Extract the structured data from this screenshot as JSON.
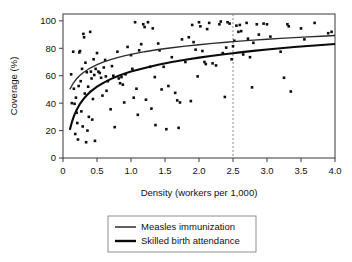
{
  "chart_data": {
    "type": "scatter",
    "title": "",
    "xlabel": "Density (workers per 1,000)",
    "ylabel": "Coverage (%)",
    "xlim": [
      0,
      4.0
    ],
    "ylim": [
      0,
      105
    ],
    "grid": false,
    "xticks": [
      0,
      0.5,
      1.0,
      1.5,
      2.0,
      2.5,
      3.0,
      3.5,
      4.0
    ],
    "xtick_labels": [
      "0",
      "0.5",
      "1.0",
      "1.5",
      "2.0",
      "2.5",
      "3.0",
      "3.5",
      "4.0"
    ],
    "yticks": [
      0,
      20,
      40,
      60,
      80,
      100
    ],
    "ytick_labels": [
      "0",
      "20",
      "40",
      "60",
      "80",
      "100"
    ],
    "legend_position": "below-plot",
    "annotations": [
      {
        "name": "threshold-line",
        "type": "vertical-dashed-line",
        "x": 2.5,
        "label": ""
      }
    ],
    "series": [
      {
        "name": "Measles immunization",
        "type": "curve",
        "style": "thin-line",
        "color": "#2b2b2b",
        "points": [
          [
            0.1,
            50.0
          ],
          [
            0.15,
            54.5
          ],
          [
            0.2,
            57.8
          ],
          [
            0.25,
            60.3
          ],
          [
            0.3,
            62.4
          ],
          [
            0.4,
            65.6
          ],
          [
            0.5,
            68.1
          ],
          [
            0.6,
            70.1
          ],
          [
            0.7,
            71.8
          ],
          [
            0.8,
            73.2
          ],
          [
            0.9,
            74.5
          ],
          [
            1.0,
            75.6
          ],
          [
            1.2,
            77.5
          ],
          [
            1.4,
            79.1
          ],
          [
            1.6,
            80.4
          ],
          [
            1.8,
            81.6
          ],
          [
            2.0,
            82.6
          ],
          [
            2.2,
            83.6
          ],
          [
            2.4,
            84.4
          ],
          [
            2.5,
            84.8
          ],
          [
            2.6,
            85.2
          ],
          [
            2.8,
            85.9
          ],
          [
            3.0,
            86.6
          ],
          [
            3.2,
            87.2
          ],
          [
            3.4,
            87.8
          ],
          [
            3.6,
            88.3
          ],
          [
            3.8,
            88.8
          ],
          [
            4.0,
            89.3
          ]
        ]
      },
      {
        "name": "Skilled birth attendance",
        "type": "curve",
        "style": "thick-line",
        "color": "#0a0a0a",
        "points": [
          [
            0.1,
            20.5
          ],
          [
            0.13,
            26.0
          ],
          [
            0.16,
            30.5
          ],
          [
            0.2,
            35.0
          ],
          [
            0.25,
            39.5
          ],
          [
            0.3,
            43.0
          ],
          [
            0.35,
            45.8
          ],
          [
            0.4,
            48.2
          ],
          [
            0.5,
            52.0
          ],
          [
            0.6,
            55.0
          ],
          [
            0.7,
            57.5
          ],
          [
            0.8,
            59.6
          ],
          [
            0.9,
            61.4
          ],
          [
            1.0,
            63.0
          ],
          [
            1.2,
            65.7
          ],
          [
            1.4,
            68.0
          ],
          [
            1.6,
            70.0
          ],
          [
            1.8,
            71.7
          ],
          [
            2.0,
            73.2
          ],
          [
            2.2,
            74.6
          ],
          [
            2.4,
            75.8
          ],
          [
            2.5,
            76.4
          ],
          [
            2.6,
            77.0
          ],
          [
            2.8,
            78.1
          ],
          [
            3.0,
            79.1
          ],
          [
            3.2,
            80.0
          ],
          [
            3.4,
            80.9
          ],
          [
            3.6,
            81.7
          ],
          [
            3.8,
            82.4
          ],
          [
            4.0,
            83.1
          ]
        ]
      },
      {
        "name": "Measles immunization data points",
        "type": "scatter",
        "marker": "square",
        "color": "#0d0d0d",
        "points": [
          [
            0.12,
            61.0
          ],
          [
            0.13,
            40.0
          ],
          [
            0.15,
            77.5
          ],
          [
            0.16,
            50.5
          ],
          [
            0.18,
            17.5
          ],
          [
            0.19,
            44.0
          ],
          [
            0.2,
            33.0
          ],
          [
            0.21,
            25.5
          ],
          [
            0.22,
            13.5
          ],
          [
            0.24,
            77.0
          ],
          [
            0.25,
            78.0
          ],
          [
            0.26,
            56.0
          ],
          [
            0.27,
            34.0
          ],
          [
            0.28,
            65.0
          ],
          [
            0.29,
            23.0
          ],
          [
            0.3,
            90.5
          ],
          [
            0.31,
            88.0
          ],
          [
            0.32,
            47.0
          ],
          [
            0.33,
            69.5
          ],
          [
            0.34,
            11.5
          ],
          [
            0.35,
            62.5
          ],
          [
            0.36,
            20.0
          ],
          [
            0.37,
            52.0
          ],
          [
            0.38,
            30.0
          ],
          [
            0.4,
            92.0
          ],
          [
            0.41,
            63.0
          ],
          [
            0.42,
            58.0
          ],
          [
            0.44,
            43.0
          ],
          [
            0.45,
            72.0
          ],
          [
            0.46,
            60.5
          ],
          [
            0.47,
            12.5
          ],
          [
            0.48,
            65.0
          ],
          [
            0.5,
            76.5
          ],
          [
            0.52,
            63.0
          ],
          [
            0.54,
            62.0
          ],
          [
            0.56,
            58.5
          ],
          [
            0.58,
            45.5
          ],
          [
            0.6,
            66.0
          ],
          [
            0.62,
            71.5
          ],
          [
            0.64,
            49.0
          ],
          [
            0.66,
            56.0
          ],
          [
            0.7,
            35.5
          ],
          [
            0.72,
            67.0
          ],
          [
            0.74,
            60.0
          ],
          [
            0.76,
            22.5
          ],
          [
            0.8,
            77.5
          ],
          [
            0.82,
            58.0
          ],
          [
            0.84,
            54.5
          ],
          [
            0.86,
            59.0
          ],
          [
            0.88,
            53.5
          ],
          [
            0.9,
            40.5
          ],
          [
            0.95,
            81.0
          ],
          [
            1.0,
            75.0
          ],
          [
            1.02,
            65.0
          ],
          [
            1.04,
            44.0
          ],
          [
            1.06,
            99.0
          ],
          [
            1.08,
            50.5
          ],
          [
            1.1,
            31.5
          ],
          [
            1.12,
            78.5
          ],
          [
            1.15,
            83.0
          ],
          [
            1.18,
            97.5
          ],
          [
            1.2,
            95.5
          ],
          [
            1.22,
            42.5
          ],
          [
            1.25,
            99.0
          ],
          [
            1.28,
            66.5
          ],
          [
            1.3,
            36.0
          ],
          [
            1.32,
            94.5
          ],
          [
            1.35,
            59.0
          ],
          [
            1.36,
            24.0
          ],
          [
            1.4,
            83.5
          ],
          [
            1.45,
            50.0
          ],
          [
            1.48,
            66.5
          ],
          [
            1.52,
            21.0
          ],
          [
            1.55,
            52.5
          ],
          [
            1.6,
            73.5
          ],
          [
            1.65,
            47.5
          ],
          [
            1.68,
            42.0
          ],
          [
            1.7,
            22.0
          ],
          [
            1.72,
            40.5
          ],
          [
            1.75,
            86.5
          ],
          [
            1.8,
            70.0
          ],
          [
            1.85,
            88.0
          ],
          [
            1.88,
            41.5
          ],
          [
            1.9,
            97.0
          ],
          [
            1.92,
            84.5
          ],
          [
            1.95,
            79.0
          ],
          [
            1.98,
            59.5
          ],
          [
            2.0,
            99.0
          ],
          [
            2.02,
            96.0
          ],
          [
            2.05,
            78.0
          ],
          [
            2.08,
            70.0
          ],
          [
            2.1,
            68.5
          ],
          [
            2.15,
            98.5
          ],
          [
            2.2,
            69.0
          ],
          [
            2.25,
            67.5
          ],
          [
            2.3,
            97.5
          ],
          [
            2.32,
            99.5
          ],
          [
            2.35,
            76.5
          ],
          [
            2.38,
            44.5
          ],
          [
            2.4,
            80.5
          ],
          [
            2.42,
            99.0
          ],
          [
            2.45,
            98.0
          ],
          [
            2.48,
            72.0
          ],
          [
            2.5,
            81.5
          ],
          [
            2.52,
            85.5
          ],
          [
            2.55,
            96.5
          ],
          [
            2.58,
            92.0
          ],
          [
            2.6,
            97.0
          ],
          [
            2.65,
            75.5
          ],
          [
            2.7,
            98.5
          ],
          [
            2.72,
            87.0
          ],
          [
            2.75,
            73.5
          ],
          [
            2.78,
            51.5
          ],
          [
            2.8,
            84.0
          ],
          [
            2.85,
            97.5
          ],
          [
            2.88,
            90.0
          ],
          [
            2.95,
            98.0
          ],
          [
            3.0,
            97.5
          ],
          [
            3.05,
            88.5
          ],
          [
            3.2,
            77.5
          ],
          [
            3.25,
            58.5
          ],
          [
            3.3,
            97.5
          ],
          [
            3.32,
            96.0
          ],
          [
            3.35,
            48.5
          ],
          [
            3.5,
            94.5
          ],
          [
            3.55,
            86.5
          ],
          [
            3.7,
            98.5
          ],
          [
            3.9,
            91.0
          ],
          [
            3.95,
            92.0
          ],
          [
            0.17,
            39.5
          ],
          [
            0.23,
            52.5
          ],
          [
            0.43,
            28.0
          ],
          [
            0.63,
            59.5
          ],
          [
            0.92,
            61.0
          ],
          [
            1.42,
            78.5
          ],
          [
            2.12,
            94.0
          ],
          [
            2.62,
            92.5
          ]
        ]
      }
    ]
  },
  "axes": {
    "x_title": "Density (workers per 1,000)",
    "y_title": "Coverage (%)",
    "x_labels": [
      "0",
      "0.5",
      "1.0",
      "1.5",
      "2.0",
      "2.5",
      "3.0",
      "3.5",
      "4.0"
    ],
    "y_labels": [
      "0",
      "20",
      "40",
      "60",
      "80",
      "100"
    ]
  },
  "legend": {
    "items": [
      {
        "label": "Measles immunization",
        "swatch": "thin-line",
        "color": "#2b2b2b"
      },
      {
        "label": "Skilled birth attendance",
        "swatch": "thick-line",
        "color": "#0a0a0a"
      }
    ]
  },
  "colors": {
    "measles_line": "#2b2b2b",
    "sba_line": "#0a0a0a",
    "marker": "#0d0d0d",
    "frame": "#4a4a4a",
    "reference_line": "#8a8a8a",
    "background": "#ffffff"
  }
}
